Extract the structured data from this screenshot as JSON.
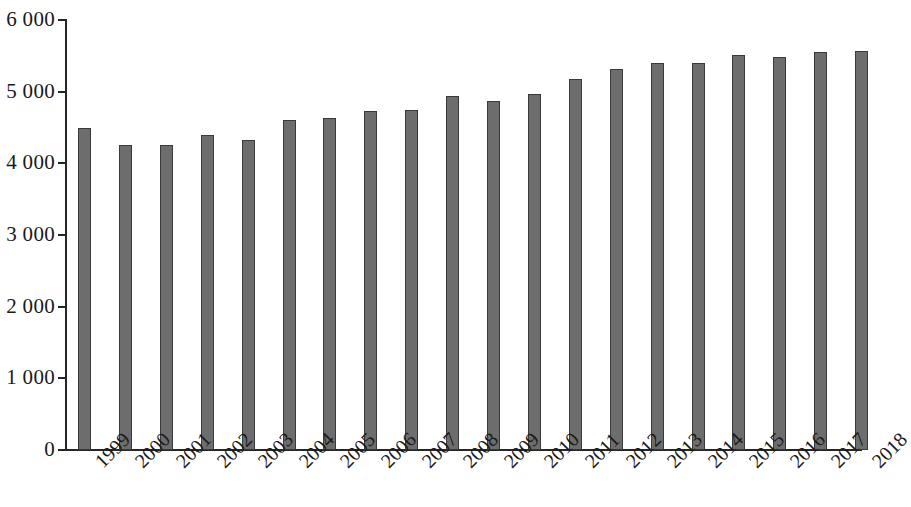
{
  "chart_data": {
    "type": "bar",
    "title": "",
    "subtitle": "",
    "xlabel": "",
    "ylabel": "",
    "categories": [
      "1999",
      "2000",
      "2001",
      "2002",
      "2003",
      "2004",
      "2005",
      "2006",
      "2007",
      "2008",
      "2009",
      "2010",
      "2011",
      "2012",
      "2013",
      "2014",
      "2015",
      "2016",
      "2017",
      "2018"
    ],
    "values": [
      4500,
      4260,
      4260,
      4390,
      4320,
      4610,
      4630,
      4730,
      4740,
      4940,
      4870,
      4970,
      5170,
      5320,
      5400,
      5400,
      5510,
      5490,
      5560,
      5570
    ],
    "ylim": [
      0,
      6000
    ],
    "y_ticks": [
      0,
      1000,
      2000,
      3000,
      4000,
      5000,
      6000
    ],
    "y_tick_labels": [
      "0",
      "1 000",
      "2 000",
      "3 000",
      "4 000",
      "5 000",
      "6 000"
    ],
    "grid": false,
    "legend": null,
    "legend_position": "none",
    "bar_color": "#6d6d6d",
    "bar_edge_color": "#3a3a3a",
    "axis_color": "#262626",
    "background_color": "#ffffff",
    "x_tick_label_rotation": -45,
    "annotations": []
  }
}
